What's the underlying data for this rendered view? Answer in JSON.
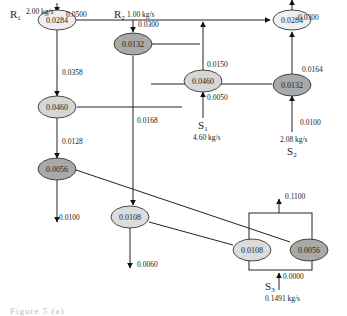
{
  "colors": {
    "light_node": "#ececec",
    "mid_node": "#d6d6d6",
    "dark_node": "#a8a8a8",
    "edge": "#222222",
    "source_label_faint": "#b0b0b0"
  },
  "sources": {
    "R1": {
      "label": "R",
      "sub": "1",
      "flow": "2.00 kg/s"
    },
    "R2": {
      "label": "R",
      "sub": "2",
      "flow": "1.00 kg/s"
    },
    "S1": {
      "label": "S",
      "sub": "1",
      "flow": "4.60 kg/s"
    },
    "S2": {
      "label": "S",
      "sub": "2",
      "flow": "2.08 kg/s"
    },
    "S3": {
      "label": "S",
      "sub": "3",
      "flow": "0.1491 kg/s"
    }
  },
  "nodes": {
    "r1_top": "0.0284",
    "top_right": "0.0284",
    "r2": "0.0132",
    "s1_node": "0.0460",
    "right_mid": "0.0132",
    "left_mid": "0.0460",
    "left_low": "0.0056",
    "mid_low": "0.0108",
    "s3_left": "0.0108",
    "s3_right": "0.0056"
  },
  "edges": {
    "r1_in": "0.0500",
    "r1_down": "0.0358",
    "top_right_out": "0.0300",
    "right_up": "0.0164",
    "s2_in": "0.0100",
    "r2_in": "0.0300",
    "s1_out": "0.0150",
    "s1_in": "0.0050",
    "r2_down": "0.0168",
    "left_down": "0.0128",
    "left_low_out": "0.0100",
    "mid_low_out": "0.0060",
    "s3_out": "0.1100",
    "s3_in": "0.0000"
  },
  "caption": "Figure 5 (a)"
}
